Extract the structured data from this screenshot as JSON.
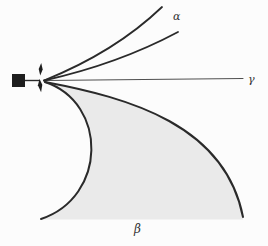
{
  "figure": {
    "labels": {
      "alpha": "α",
      "gamma": "γ",
      "beta": "β"
    },
    "colors": {
      "background": "#fcfcfc",
      "ink": "#2a2a2a",
      "source": "#1e1e1e",
      "gamma_line": "#4f4f4f",
      "beta_shade": "#eaeaea"
    }
  }
}
